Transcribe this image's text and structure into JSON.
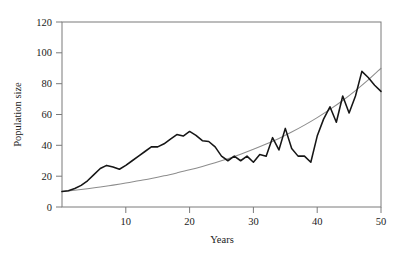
{
  "chart_data": {
    "type": "line",
    "title": "",
    "subtitle": "",
    "xlabel": "Years",
    "ylabel": "Population size",
    "xlim": [
      0,
      50
    ],
    "ylim": [
      0,
      120
    ],
    "xticks": [
      10,
      20,
      30,
      40,
      50
    ],
    "yticks": [
      0,
      20,
      40,
      60,
      80,
      100,
      120
    ],
    "xtick_labels": [
      "10",
      "20",
      "30",
      "40",
      "50"
    ],
    "ytick_labels": [
      "0",
      "20",
      "40",
      "60",
      "80",
      "100",
      "120"
    ],
    "grid": false,
    "legend": null,
    "legend_position": "none",
    "frame": "box",
    "annotations": [],
    "series": [
      {
        "name": "Stochastic population trajectory",
        "color": "#161616",
        "linewidth": 1.55,
        "x": [
          0,
          1,
          2,
          3,
          4,
          5,
          6,
          7,
          8,
          9,
          10,
          11,
          12,
          13,
          14,
          15,
          16,
          17,
          18,
          19,
          20,
          21,
          22,
          23,
          24,
          25,
          26,
          27,
          28,
          29,
          30,
          31,
          32,
          33,
          34,
          35,
          36,
          37,
          38,
          39,
          40,
          41,
          42,
          43,
          44,
          45,
          46,
          47,
          48,
          49,
          50
        ],
        "values": [
          10,
          10.5,
          12,
          14,
          17,
          21,
          25,
          27,
          26,
          24.5,
          27,
          30,
          33,
          36,
          39,
          39,
          41,
          44,
          47,
          46,
          49,
          46.5,
          43,
          42.5,
          39,
          33,
          30,
          33,
          30,
          33,
          29,
          34,
          33,
          45,
          37,
          51,
          38,
          33,
          33,
          29,
          46,
          57,
          65,
          55,
          72,
          61,
          72,
          88,
          84,
          79,
          75
        ]
      },
      {
        "name": "Deterministic exponential growth",
        "color": "#8d8d8d",
        "linewidth": 1.05,
        "x": [
          0,
          2,
          4,
          6,
          8,
          10,
          12,
          14,
          16,
          18,
          20,
          22,
          24,
          26,
          28,
          30,
          32,
          34,
          36,
          38,
          40,
          42,
          44,
          46,
          48,
          50
        ],
        "values": [
          10,
          10.9,
          11.9,
          13.0,
          14.2,
          15.5,
          17.0,
          18.5,
          20.2,
          22.1,
          24.1,
          26.3,
          28.7,
          31.3,
          34.2,
          37.4,
          40.8,
          44.5,
          48.6,
          53.1,
          58.0,
          63.3,
          69.1,
          75.5,
          82.4,
          90.0
        ]
      }
    ]
  },
  "axis": {
    "x_title": "Years",
    "y_title": "Population size"
  }
}
